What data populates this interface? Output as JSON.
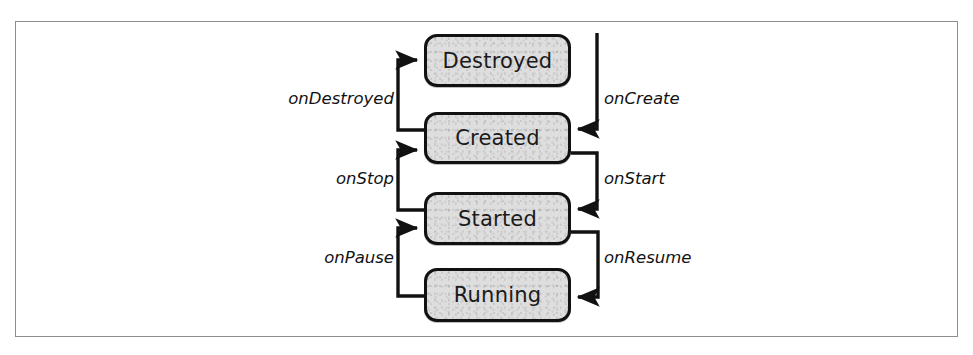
{
  "figure": {
    "type": "state-transition-diagram",
    "frame": {
      "border_color": "#8d8d93",
      "background": "#ffffff"
    }
  },
  "style": {
    "box_fill": "#dedede",
    "box_border": "#111111",
    "arrow_color": "#111111",
    "text_color": "#1a1a1a"
  },
  "states": [
    {
      "id": "destroyed",
      "label": "Destroyed",
      "x": 424,
      "y": 34,
      "width": 147,
      "height": 53
    },
    {
      "id": "created",
      "label": "Created",
      "x": 424,
      "y": 112,
      "width": 147,
      "height": 52
    },
    {
      "id": "started",
      "label": "Started",
      "x": 424,
      "y": 192,
      "width": 147,
      "height": 53
    },
    {
      "id": "running",
      "label": "Running",
      "x": 424,
      "y": 268,
      "width": 147,
      "height": 54
    }
  ],
  "transitions": [
    {
      "id": "on-create",
      "label": "onCreate",
      "from": "entry",
      "to": "created",
      "side": "right",
      "label_x": 604,
      "label_y": 90
    },
    {
      "id": "on-start",
      "label": "onStart",
      "from": "created",
      "to": "started",
      "side": "right",
      "label_x": 604,
      "label_y": 170
    },
    {
      "id": "on-resume",
      "label": "onResume",
      "from": "started",
      "to": "running",
      "side": "right",
      "label_x": 604,
      "label_y": 249
    },
    {
      "id": "on-destroyed",
      "label": "onDestroyed",
      "from": "created",
      "to": "destroyed",
      "side": "left",
      "label_right": 579,
      "label_y": 90
    },
    {
      "id": "on-stop",
      "label": "onStop",
      "from": "started",
      "to": "created",
      "side": "left",
      "label_right": 579,
      "label_y": 170
    },
    {
      "id": "on-pause",
      "label": "onPause",
      "from": "running",
      "to": "started",
      "side": "left",
      "label_right": 579,
      "label_y": 249
    }
  ]
}
